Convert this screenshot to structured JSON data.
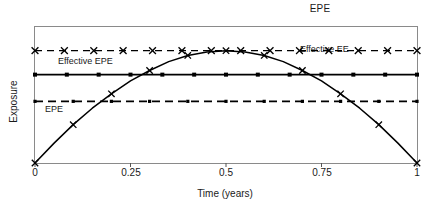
{
  "chart_data": {
    "type": "line",
    "title": "EPE",
    "xlabel": "Time (years)",
    "ylabel": "Exposure",
    "xlim": [
      0,
      1
    ],
    "ylim": [
      0,
      1
    ],
    "xticks": [
      0,
      0.25,
      0.5,
      0.75,
      1
    ],
    "xticklabels": [
      "0",
      "0.25",
      "0.5",
      "0.75",
      "1"
    ],
    "yticks": [],
    "yticklabels": [],
    "grid": false,
    "legend_position": "inline-annotations",
    "series": [
      {
        "name": "EE profile",
        "style": "solid-with-x-markers",
        "color": "#000000",
        "x": [
          0,
          0.05,
          0.1,
          0.15,
          0.2,
          0.25,
          0.3,
          0.35,
          0.4,
          0.45,
          0.5,
          0.55,
          0.6,
          0.65,
          0.7,
          0.75,
          0.8,
          0.85,
          0.9,
          0.95,
          1
        ],
        "y": [
          0.0,
          0.145,
          0.28,
          0.4,
          0.505,
          0.6,
          0.675,
          0.74,
          0.785,
          0.81,
          0.82,
          0.81,
          0.785,
          0.74,
          0.675,
          0.6,
          0.505,
          0.4,
          0.28,
          0.145,
          0.0
        ]
      },
      {
        "name": "Effective EE",
        "label": "Effective EE",
        "style": "dashed-with-x-markers",
        "color": "#000000",
        "level": 0.82,
        "x": [
          0,
          1
        ],
        "y": [
          0.82,
          0.82
        ]
      },
      {
        "name": "Effective EPE",
        "label": "Effective EPE",
        "style": "solid-with-square-markers",
        "color": "#000000",
        "level": 0.645,
        "x": [
          0,
          1
        ],
        "y": [
          0.645,
          0.645
        ]
      },
      {
        "name": "EPE",
        "label": "EPE",
        "style": "dashed",
        "color": "#000000",
        "level": 0.45,
        "x": [
          0,
          1
        ],
        "y": [
          0.45,
          0.45
        ]
      }
    ],
    "annotations": [
      {
        "text": "Effective EPE",
        "x": 0.065,
        "y": 0.73
      },
      {
        "text": "Effective EE",
        "x": 0.695,
        "y": 0.915
      },
      {
        "text": "EPE",
        "x": 0.055,
        "y": 0.365
      }
    ]
  },
  "axes": {
    "tick_0": "0",
    "tick_1": "0.25",
    "tick_2": "0.5",
    "tick_3": "0.75",
    "tick_4": "1"
  }
}
